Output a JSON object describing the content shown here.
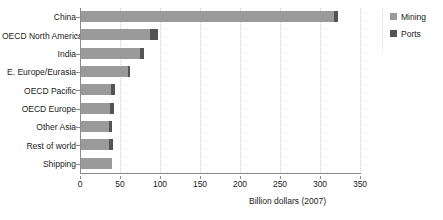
{
  "chart_data": {
    "type": "bar",
    "orientation": "horizontal",
    "stacked": true,
    "title": "",
    "xlabel": "Billion dollars (2007)",
    "ylabel": "",
    "xlim": [
      0,
      350
    ],
    "xticks": [
      0,
      50,
      100,
      150,
      200,
      250,
      300,
      350
    ],
    "grid": true,
    "grid_axis": "x",
    "legend_position": "right",
    "categories": [
      "China",
      "OECD North America",
      "India",
      "E. Europe/Eurasia",
      "OECD Pacific",
      "OECD Europe",
      "Other Asia",
      "Rest of world",
      "Shipping"
    ],
    "series": [
      {
        "name": "Mining",
        "color": "#9a9a9a",
        "values": [
          318,
          87,
          75,
          60,
          39,
          38,
          36,
          36,
          40
        ]
      },
      {
        "name": "Ports",
        "color": "#545454",
        "values": [
          4,
          10,
          5,
          3,
          5,
          5,
          4,
          5,
          0
        ]
      }
    ],
    "totals": [
      322,
      97,
      80,
      63,
      44,
      43,
      40,
      41,
      40
    ]
  },
  "legend": {
    "items": [
      {
        "label": "Mining",
        "color": "#9a9a9a"
      },
      {
        "label": "Ports",
        "color": "#545454"
      }
    ]
  },
  "axis": {
    "x_title": "Billion dollars (2007)"
  }
}
